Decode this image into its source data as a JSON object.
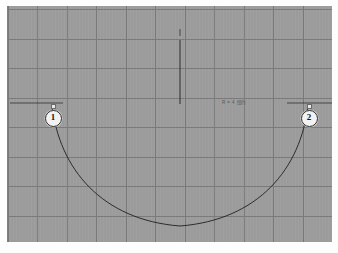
{
  "app": {
    "frame_background": "#fdfdfd",
    "canvas_background": "#9b9b9b",
    "grid_line_color": "#6e6e6e",
    "geometry_color": "#1f1f1f"
  },
  "canvas": {
    "left": 7,
    "top": 6,
    "width": 325,
    "height": 236
  },
  "grid": {
    "spacing_px": 29.5,
    "origin_x": 1,
    "origin_y": 4,
    "vertical_count": 12,
    "horizontal_count": 9,
    "visible": true
  },
  "annotation": {
    "text": "R = 4 纽约",
    "x": 215,
    "y": 93
  },
  "markers": [
    {
      "label": "1",
      "x": 45,
      "y": 111,
      "node_x": 45,
      "node_y": 99
    },
    {
      "label": "2",
      "x": 301,
      "y": 111,
      "node_x": 301,
      "node_y": 99
    }
  ],
  "curve": {
    "type": "catenary",
    "start": {
      "x": 45,
      "y": 99
    },
    "end": {
      "x": 301,
      "y": 99
    },
    "vertex": {
      "x": 173,
      "y": 220
    },
    "path": "M 45 99 C 52 163, 95 214, 173 220 C 251 214, 294 163, 301 99",
    "stroke_width": 0.9
  },
  "guides": [
    {
      "name": "axis-vertical",
      "x1": 173,
      "y1": 34,
      "x2": 173,
      "y2": 98,
      "width": 0.9
    },
    {
      "name": "level-left",
      "x1": 3,
      "y1": 97,
      "x2": 56,
      "y2": 97,
      "width": 0.7
    },
    {
      "name": "level-right",
      "x1": 280,
      "y1": 97,
      "x2": 325,
      "y2": 97,
      "width": 0.7
    },
    {
      "name": "tick-vertex",
      "x1": 173,
      "y1": 23,
      "x2": 173,
      "y2": 30,
      "width": 0.7
    }
  ]
}
